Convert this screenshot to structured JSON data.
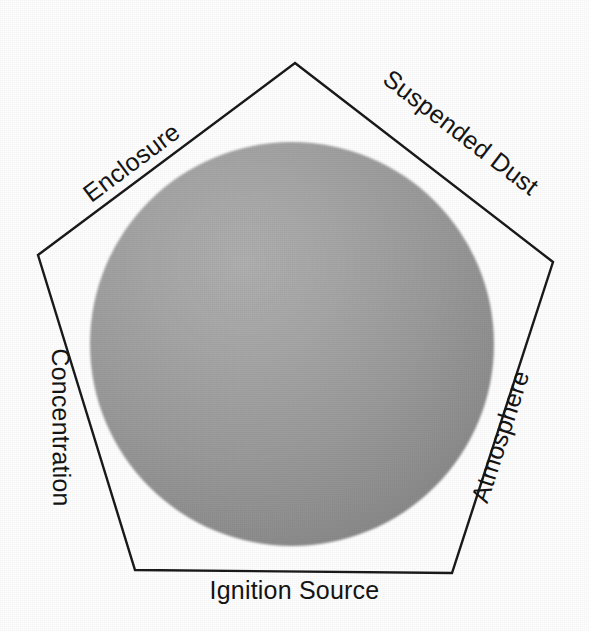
{
  "figure": {
    "name": "dust-explosion-pentagon",
    "background_color": "#ffffff",
    "width": 589,
    "height": 631
  },
  "chart_data": {
    "type": "diagram",
    "subtype": "pentagon",
    "title": "",
    "shape": {
      "name": "pentagon",
      "sides": 5,
      "stroke_color": "#1a1a1a",
      "stroke_width": 2,
      "fill": "none",
      "vertices": [
        {
          "name": "apex",
          "x": 295,
          "y": 63
        },
        {
          "name": "right",
          "x": 553,
          "y": 262
        },
        {
          "name": "bottom-right",
          "x": 452,
          "y": 573
        },
        {
          "name": "bottom-left",
          "x": 135,
          "y": 570
        },
        {
          "name": "left",
          "x": 38,
          "y": 255
        }
      ]
    },
    "inner_shape": {
      "name": "circle",
      "center_x": 292,
      "center_y": 344,
      "radius": 202,
      "fill_center_color": "#a2a2a2",
      "fill_edge_color": "#868686",
      "highlight_color": "#adadad"
    },
    "edge_labels": [
      {
        "id": "enclosure",
        "label": "Enclosure",
        "edge": "upper-left",
        "rotation_deg": -36.8,
        "side": "inside"
      },
      {
        "id": "suspended-dust",
        "label": "Suspended Dust",
        "edge": "upper-right",
        "rotation_deg": 37.5,
        "side": "outside"
      },
      {
        "id": "concentration",
        "label": "Concentration",
        "edge": "left",
        "rotation_deg": 89.5,
        "side": "inside"
      },
      {
        "id": "atmosphere",
        "label": "Atmosphere",
        "edge": "right",
        "rotation_deg": -72,
        "side": "outside"
      },
      {
        "id": "ignition-source",
        "label": "Ignition Source",
        "edge": "bottom",
        "rotation_deg": 0,
        "side": "outside"
      }
    ]
  },
  "labels": {
    "enclosure": "Enclosure",
    "suspended_dust": "Suspended Dust",
    "concentration": "Concentration",
    "atmosphere": "Atmosphere",
    "ignition_source": "Ignition Source"
  },
  "colors": {
    "outline": "#1a1a1a",
    "text": "#141414",
    "circle_light": "#adadad",
    "circle_mid": "#9c9c9c",
    "circle_dark": "#848484",
    "background": "#ffffff"
  }
}
